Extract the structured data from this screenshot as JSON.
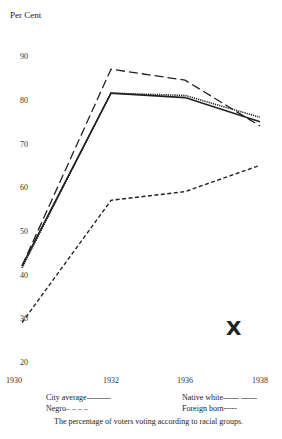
{
  "chart_data": {
    "type": "line",
    "title": "",
    "ylabel": "Per Cent",
    "xlabel": "",
    "x": [
      "1930",
      "1932",
      "1936",
      "1938"
    ],
    "x_values": [
      1930,
      1932,
      1936,
      1938
    ],
    "ylim": [
      20,
      90
    ],
    "yticks": [
      20,
      30,
      40,
      50,
      60,
      70,
      80,
      90
    ],
    "grid": false,
    "series": [
      {
        "name": "City average",
        "legend": "City average———",
        "style": "solid",
        "values": [
          42,
          81.5,
          80.5,
          75
        ]
      },
      {
        "name": "Native white",
        "legend": "Native white—— ——",
        "style": "longdash",
        "values": [
          42,
          87,
          84.5,
          74
        ]
      },
      {
        "name": "Negro",
        "legend": "Negro– – – –",
        "style": "dash",
        "values": [
          29,
          57,
          59,
          65
        ]
      },
      {
        "name": "Foreign born",
        "legend": "Foreign born-----",
        "style": "dotted",
        "values": [
          41.5,
          81.5,
          81,
          76
        ]
      }
    ],
    "caption": "The percentage of voters voting according to racial groups.",
    "annotation": "X"
  }
}
